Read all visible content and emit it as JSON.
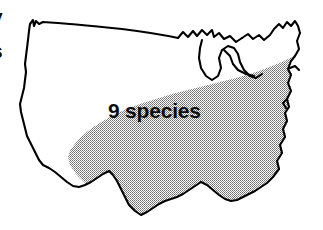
{
  "figure": {
    "kind": "distribution-map",
    "background_color": "#ffffff",
    "outline_color": "#000000",
    "shade_color": "#a8a8a8",
    "shade_pattern": "halftone-dots"
  },
  "labels": {
    "region_label": "9 species"
  },
  "legend_note": {
    "shaded_region_label": "9 species"
  },
  "edge_fragments": [
    "y",
    "s",
    ".",
    ",",
    "."
  ]
}
